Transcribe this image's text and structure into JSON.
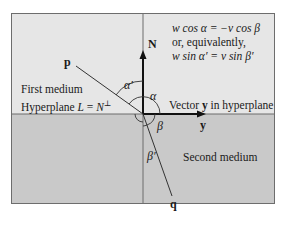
{
  "diagram": {
    "regions": {
      "first_medium": "First medium",
      "second_medium": "Second medium",
      "top_color": "#e6e6e6",
      "bottom_color": "#c9c9c9"
    },
    "hyperplane_label": "Hyperplane L = N⊥",
    "hyperplane_label_parts": {
      "prefix": "Hyperplane ",
      "L": "L",
      "eq": " = ",
      "N": "N",
      "perp": "⊥"
    },
    "vectors": {
      "normal": "N",
      "tangent": "y",
      "incident": "p",
      "refracted": "q"
    },
    "vector_y_caption": {
      "prefix": "Vector ",
      "y": "y",
      "suffix": " in hyperplane"
    },
    "angles": {
      "alpha": "α",
      "alpha_prime": "α′",
      "beta": "β",
      "beta_prime": "β′"
    },
    "equations": {
      "line1": "w cos α = −v cos β",
      "line2": "or, equivalently,",
      "line3": "w sin α′ = v sin β′"
    }
  }
}
